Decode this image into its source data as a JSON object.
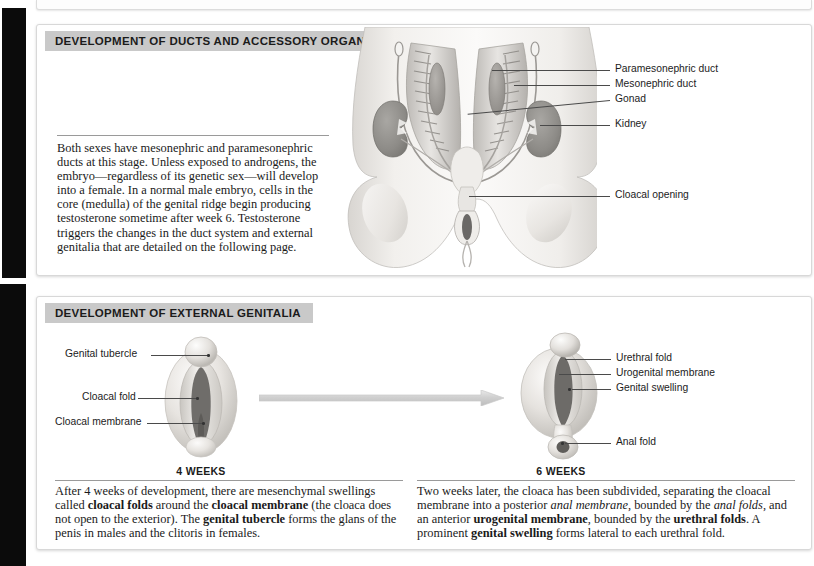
{
  "figure": {
    "panels": [
      {
        "id": "ducts",
        "header": "DEVELOPMENT OF DUCTS AND ACCESSORY ORGANS",
        "body_text": "Both sexes have mesonephric and paramesonephric ducts at this stage. Unless exposed to androgens, the embryo—regardless of its genetic sex—will develop into a female. In a normal male embryo, cells in the core (medulla) of the genital ridge begin producing testosterone sometime after week 6. Testosterone triggers the changes in the duct system and external genitalia that are detailed on the following page.",
        "labels": [
          "Paramesonephric duct",
          "Mesonephric duct",
          "Gonad",
          "Kidney",
          "Cloacal opening"
        ]
      },
      {
        "id": "external-genitalia",
        "header": "DEVELOPMENT OF EXTERNAL GENITALIA",
        "labels_left": [
          "Genital tubercle",
          "Cloacal fold",
          "Cloacal membrane"
        ],
        "labels_right": [
          "Urethral fold",
          "Urogenital membrane",
          "Genital swelling",
          "Anal fold"
        ],
        "stage_left": "4 WEEKS",
        "stage_right": "6 WEEKS",
        "caption_left_parts": [
          {
            "text": "After 4 weeks of development, there are mesenchymal swellings called ",
            "style": "normal"
          },
          {
            "text": "cloacal folds",
            "style": "bold"
          },
          {
            "text": " around the ",
            "style": "normal"
          },
          {
            "text": "cloacal membrane",
            "style": "bold"
          },
          {
            "text": " (the cloaca does not open to the exterior). The ",
            "style": "normal"
          },
          {
            "text": "genital tubercle",
            "style": "bold"
          },
          {
            "text": " forms the glans of the penis in males and the clitoris in females.",
            "style": "normal"
          }
        ],
        "caption_right_parts": [
          {
            "text": "Two weeks later, the cloaca has been subdivided, separating the cloacal membrane into a posterior ",
            "style": "normal"
          },
          {
            "text": "anal membrane",
            "style": "italic"
          },
          {
            "text": ", bounded by the ",
            "style": "normal"
          },
          {
            "text": "anal folds",
            "style": "italic"
          },
          {
            "text": ", and an anterior ",
            "style": "normal"
          },
          {
            "text": "urogenital membrane",
            "style": "bold"
          },
          {
            "text": ", bounded by the ",
            "style": "normal"
          },
          {
            "text": "urethral folds",
            "style": "bold"
          },
          {
            "text": ". A prominent ",
            "style": "normal"
          },
          {
            "text": "genital swelling",
            "style": "bold"
          },
          {
            "text": " forms lateral to each urethral fold.",
            "style": "normal"
          }
        ]
      }
    ],
    "colors": {
      "header_bg": "#c9c9c9",
      "panel_border": "#d8d8d8",
      "leader_line": "#4a4a4a",
      "tissue_light": "#eceae7",
      "tissue_mid": "#c9c6c2",
      "tissue_dark": "#8f8d8a",
      "lumen_dark": "#6f6d6b",
      "arrow": "#d2d2d2"
    }
  }
}
